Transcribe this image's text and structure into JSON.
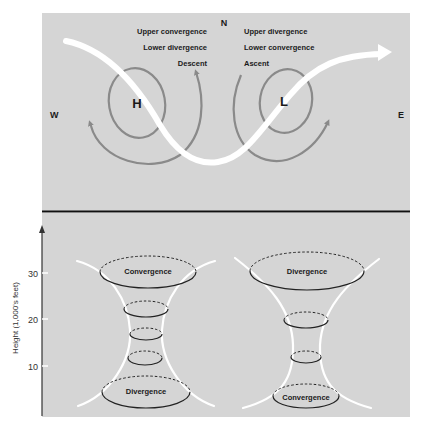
{
  "map_panel": {
    "compass": {
      "north": "N",
      "west": "W",
      "east": "E"
    },
    "high": {
      "symbol": "H",
      "labels": [
        "Upper convergence",
        "Lower divergence",
        "Descent"
      ]
    },
    "low": {
      "symbol": "L",
      "labels": [
        "Upper divergence",
        "Lower convergence",
        "Ascent"
      ]
    }
  },
  "profile_panel": {
    "y_axis": {
      "label": "Height (1,000's feet)",
      "ticks": [
        "30",
        "20",
        "10"
      ]
    },
    "high_column": {
      "top_label": "Convergence",
      "bottom_label": "Divergence"
    },
    "low_column": {
      "top_label": "Divergence",
      "bottom_label": "Convergence"
    }
  },
  "colors": {
    "panel_bg": "#d5d5d5",
    "circulation": "#8a8a8a",
    "jet_stream": "#ffffff",
    "divider": "#111111"
  }
}
